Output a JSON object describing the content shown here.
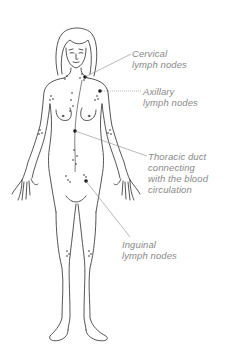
{
  "diagram": {
    "line_color": "#2b2b2b",
    "label_color": "#8a8a8a",
    "node_color": "#111111",
    "labels": [
      {
        "id": "cervical",
        "lines": [
          "Cervical",
          "lymph nodes"
        ]
      },
      {
        "id": "axillary",
        "lines": [
          "Axillary",
          "lymph nodes"
        ]
      },
      {
        "id": "thoracic",
        "lines": [
          "Thoracic duct",
          "connecting",
          "with the blood",
          "circulation"
        ]
      },
      {
        "id": "inguinal",
        "lines": [
          "Inguinal",
          "lymph nodes"
        ]
      }
    ]
  }
}
